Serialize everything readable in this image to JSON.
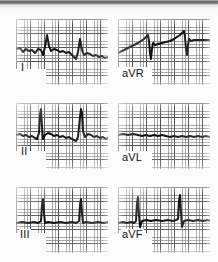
{
  "document": {
    "type": "ecg-strip",
    "title": "ECG limb leads",
    "paper": {
      "background_color": "#fbfbfa",
      "grid_minor_color": "#373737",
      "grid_major_color": "#141414",
      "trace_color": "#0b0b0b",
      "minor_box_px": 2.8,
      "major_box_px": 14
    },
    "scan_artifact": {
      "top_band_color": "#5e5e5e",
      "top_band_height_px": 5
    },
    "layout": {
      "columns": 2,
      "rows": 3,
      "order": [
        "I",
        "aVR",
        "II",
        "aVL",
        "III",
        "aVF"
      ]
    }
  },
  "panels": [
    {
      "id": "lead-i",
      "label": "I",
      "column": "left",
      "row": 1,
      "x": 16,
      "y": 19,
      "width": 92,
      "height": 66,
      "label_x": 20,
      "label_y": 68,
      "description": "low voltage complexes, downsloping baseline, small R waves",
      "path": "M0,30 L4,29 L7,33 L10,30 L13,32 L16,31 L19,34 L22,30 L25,31 L27,36 L29,28 L31,16 L33,27 L35,32 L38,30 L41,31 L44,33 L47,32 L50,34 L53,33 L56,36 L58,38 L60,40 L62,33 L64,20 L66,31 L68,36 L71,34 L74,35 L77,37 L80,36 L83,38 L86,37 L89,39 L92,38"
    },
    {
      "id": "lead-avr",
      "label": "aVR",
      "column": "right",
      "row": 1,
      "x": 118,
      "y": 19,
      "width": 92,
      "height": 66,
      "label_x": 122,
      "label_y": 68,
      "description": "rising wandering baseline with negative QS deflections",
      "path": "M0,34 L4,32 L8,30 L12,28 L16,26 L20,24 L23,22 L26,20 L28,18 L30,16 L31,22 L32,34 L33,40 L34,30 L35,24 L37,26 L40,25 L44,24 L48,23 L52,22 L56,20 L59,18 L62,16 L64,14 L66,12 L67,18 L68,30 L69,36 L70,26 L71,20 L73,22 L76,21 L80,21 L84,21 L88,21 L92,21"
    },
    {
      "id": "lead-ii",
      "label": "II",
      "column": "left",
      "row": 2,
      "x": 16,
      "y": 103,
      "width": 92,
      "height": 66,
      "label_x": 20,
      "label_y": 152,
      "description": "tall upright R waves, rate ~ regular, ST depression between beats",
      "path": "M0,32 L4,31 L7,33 L10,32 L13,34 L16,33 L19,35 L21,36 L23,30 L24,12 L25,6 L26,24 L27,36 L29,32 L32,30 L35,31 L38,33 L41,32 L44,34 L47,33 L50,35 L53,34 L56,36 L58,37 L60,38 L62,34 L64,14 L65,6 L66,10 L67,28 L69,34 L72,31 L75,32 L78,34 L81,33 L84,35 L87,34 L90,36 L92,35"
    },
    {
      "id": "lead-avl",
      "label": "aVL",
      "column": "right",
      "row": 2,
      "x": 118,
      "y": 103,
      "width": 92,
      "height": 66,
      "label_x": 122,
      "label_y": 152,
      "description": "near isoelectric flat trace, very low voltage, no discernible QRS",
      "path": "M0,32 L5,31 L10,32 L15,31 L20,32 L24,33 L28,32 L32,33 L36,32 L40,33 L44,32 L48,33 L52,34 L56,33 L60,34 L64,33 L68,34 L72,33 L76,34 L80,33 L84,34 L88,33 L92,34"
    },
    {
      "id": "lead-iii",
      "label": "III",
      "column": "left",
      "row": 3,
      "x": 16,
      "y": 187,
      "width": 92,
      "height": 66,
      "label_x": 20,
      "label_y": 234,
      "description": "flat baseline with two narrow tall R spikes",
      "path": "M0,36 L6,35 L12,36 L18,35 L22,36 L25,34 L26,18 L27,12 L28,26 L29,36 L32,35 L38,36 L44,35 L50,36 L56,35 L60,36 L63,34 L64,18 L65,12 L66,26 L67,36 L70,35 L76,36 L82,35 L88,36 L92,35"
    },
    {
      "id": "lead-avf",
      "label": "aVF",
      "column": "right",
      "row": 3,
      "x": 118,
      "y": 187,
      "width": 92,
      "height": 66,
      "label_x": 122,
      "label_y": 234,
      "description": "flat baseline with two narrow tall R spikes and small s waves",
      "path": "M0,36 L5,35 L9,36 L13,35 L16,36 L18,34 L19,16 L20,10 L21,28 L22,40 L24,34 L28,33 L33,34 L38,33 L44,34 L50,33 L55,34 L58,33 L60,32 L61,14 L62,8 L63,26 L64,40 L66,34 L70,33 L75,34 L80,33 L85,34 L90,33 L92,34"
    }
  ]
}
